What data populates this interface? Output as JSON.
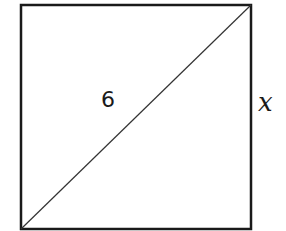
{
  "diagram": {
    "shape": "square",
    "diagonal_label": "6",
    "side_label": "x",
    "colors": {
      "stroke": "#1a1a1a",
      "background": "#ffffff"
    }
  }
}
